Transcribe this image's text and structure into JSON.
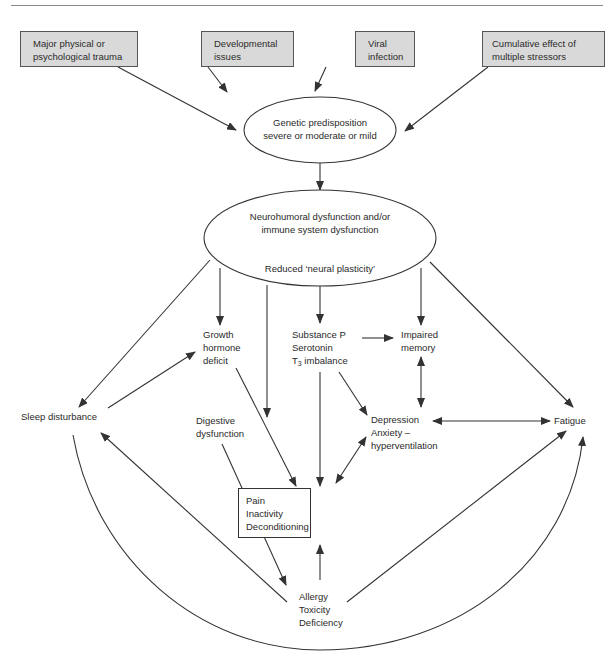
{
  "diagram": {
    "causes": [
      {
        "id": "trauma",
        "lines": [
          "Major physical or",
          "psychological trauma"
        ]
      },
      {
        "id": "developmental",
        "lines": [
          "Developmental",
          "issues"
        ]
      },
      {
        "id": "viral",
        "lines": [
          "Viral",
          "infection"
        ]
      },
      {
        "id": "stressors",
        "lines": [
          "Cumulative effect of",
          "multiple stressors"
        ]
      }
    ],
    "genetic": {
      "lines": [
        "Genetic predisposition",
        "severe or moderate or mild"
      ]
    },
    "neuro": {
      "lines": [
        "Neurohumoral dysfunction and/or",
        "immune system dysfunction"
      ],
      "subtitle": "Reduced ‘neural plasticity’"
    },
    "nodes": {
      "growth_hormone": [
        "Growth",
        "hormone",
        "deficit"
      ],
      "substance_p": {
        "line1": "Substance P",
        "line2": "Serotonin",
        "line3_prefix": "T",
        "line3_sub": "3",
        "line3_suffix": " imbalance"
      },
      "impaired_memory": [
        "Impaired",
        "memory"
      ],
      "sleep": "Sleep disturbance",
      "digestive": [
        "Digestive",
        "dysfunction"
      ],
      "depression": [
        "Depression",
        "Anxiety –",
        "hyperventilation"
      ],
      "fatigue": "Fatigue",
      "pain": [
        "Pain",
        "Inactivity",
        "Deconditioning"
      ],
      "allergy": [
        "Allergy",
        "Toxicity",
        "Deficiency"
      ]
    },
    "colors": {
      "cause_fill": "#d9d9d9",
      "stroke": "#333333",
      "text": "#2a2a2a",
      "rule": "#8a8a8a"
    },
    "edges": [
      {
        "from": "Major physical or psychological trauma",
        "to": "Genetic predisposition"
      },
      {
        "from": "Developmental issues",
        "to": "Genetic predisposition"
      },
      {
        "from": "Viral infection",
        "to": "Genetic predisposition"
      },
      {
        "from": "Cumulative effect of multiple stressors",
        "to": "Genetic predisposition"
      },
      {
        "from": "Genetic predisposition",
        "to": "Neurohumoral dysfunction"
      },
      {
        "from": "Neurohumoral dysfunction",
        "to": "Sleep disturbance"
      },
      {
        "from": "Neurohumoral dysfunction",
        "to": "Growth hormone deficit"
      },
      {
        "from": "Neurohumoral dysfunction",
        "to": "Digestive dysfunction"
      },
      {
        "from": "Neurohumoral dysfunction",
        "to": "Substance P / Serotonin / T3 imbalance"
      },
      {
        "from": "Neurohumoral dysfunction",
        "to": "Impaired memory"
      },
      {
        "from": "Neurohumoral dysfunction",
        "to": "Fatigue"
      },
      {
        "from": "Sleep disturbance",
        "to": "Growth hormone deficit"
      },
      {
        "from": "Substance P / Serotonin / T3 imbalance",
        "to": "Impaired memory"
      },
      {
        "from": "Substance P / Serotonin / T3 imbalance",
        "to": "Depression"
      },
      {
        "from": "Substance P / Serotonin / T3 imbalance",
        "to": "Pain"
      },
      {
        "from": "Impaired memory",
        "to": "Depression",
        "bidirectional": true
      },
      {
        "from": "Depression",
        "to": "Fatigue",
        "bidirectional": true
      },
      {
        "from": "Depression",
        "to": "Pain",
        "bidirectional": true
      },
      {
        "from": "Growth hormone deficit",
        "to": "Pain"
      },
      {
        "from": "Digestive dysfunction",
        "to": "Allergy"
      },
      {
        "from": "Allergy",
        "to": "Pain"
      },
      {
        "from": "Allergy",
        "to": "Sleep disturbance"
      },
      {
        "from": "Allergy",
        "to": "Fatigue"
      },
      {
        "from": "Sleep disturbance",
        "to": "Fatigue",
        "curved": true
      }
    ]
  }
}
